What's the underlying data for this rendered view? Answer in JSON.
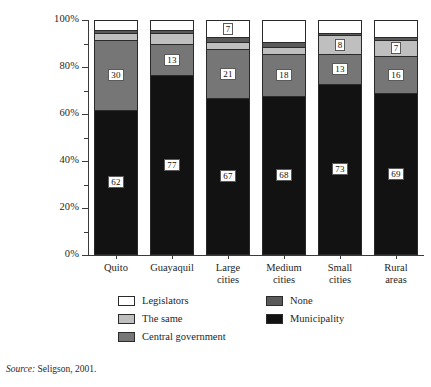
{
  "chart_data": {
    "type": "bar",
    "subtype": "stacked-percent",
    "title": "",
    "xlabel": "",
    "ylabel": "",
    "ylim": [
      0,
      100
    ],
    "ytick_labels": [
      "0%",
      "20%",
      "40%",
      "60%",
      "80%",
      "100%"
    ],
    "ytick_values": [
      0,
      20,
      40,
      60,
      80,
      100
    ],
    "minor_ticks": [
      10,
      30,
      50,
      70,
      90
    ],
    "grid": false,
    "legend_position": "bottom",
    "categories": [
      "Quito",
      "Guayaquil",
      "Large cities",
      "Medium cities",
      "Small cities",
      "Rural areas"
    ],
    "category_lines": [
      [
        "Quito"
      ],
      [
        "Guayaquil"
      ],
      [
        "Large",
        "cities"
      ],
      [
        "Medium",
        "cities"
      ],
      [
        "Small",
        "cities"
      ],
      [
        "Rural",
        "areas"
      ]
    ],
    "stack_order_bottom_to_top": [
      "Municipality",
      "Central government",
      "The same",
      "None",
      "Legislators"
    ],
    "series": [
      {
        "name": "Municipality",
        "color": "#121212",
        "values": [
          62,
          77,
          67,
          68,
          73,
          69
        ],
        "show_labels": [
          true,
          true,
          true,
          true,
          true,
          true
        ]
      },
      {
        "name": "Central government",
        "color": "#767676",
        "values": [
          30,
          13,
          21,
          18,
          13,
          16
        ],
        "show_labels": [
          true,
          true,
          true,
          true,
          true,
          true
        ]
      },
      {
        "name": "The same",
        "color": "#bfbfbf",
        "values": [
          3,
          5,
          3,
          3,
          8,
          7
        ],
        "show_labels": [
          false,
          false,
          false,
          false,
          true,
          true
        ]
      },
      {
        "name": "None",
        "color": "#5a5a5a",
        "values": [
          1,
          1,
          2,
          2,
          1,
          1
        ],
        "show_labels": [
          false,
          false,
          false,
          false,
          false,
          false
        ]
      },
      {
        "name": "Legislators",
        "color": "#ffffff",
        "values": [
          4,
          4,
          7,
          9,
          5,
          7
        ],
        "show_labels": [
          false,
          false,
          true,
          false,
          false,
          false
        ]
      }
    ]
  },
  "legend": {
    "entries": [
      {
        "label": "Legislators",
        "color": "#ffffff",
        "col": 0,
        "row": 0
      },
      {
        "label": "The same",
        "color": "#bfbfbf",
        "col": 0,
        "row": 1
      },
      {
        "label": "Central government",
        "color": "#767676",
        "col": 0,
        "row": 2
      },
      {
        "label": "None",
        "color": "#5a5a5a",
        "col": 1,
        "row": 0
      },
      {
        "label": "Municipality",
        "color": "#121212",
        "col": 1,
        "row": 1
      }
    ]
  },
  "source": {
    "label": "Source:",
    "text": " Seligson, 2001."
  }
}
